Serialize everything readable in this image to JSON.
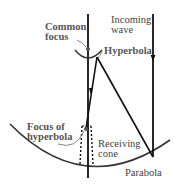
{
  "diagram": {
    "type": "cassegrain-antenna-geometry",
    "labels": {
      "common_focus": "Common\nfocus",
      "incoming_wave": "Incoming\nwave",
      "hyperbola": "Hyperbola",
      "focus_of_hyperbola": "Focus of\nhyperbola",
      "receiving_cone": "Receiving\ncone",
      "parabola": "Parabola"
    },
    "colors": {
      "line": "#111111",
      "curve": "#333333",
      "text": "#444444",
      "leader": "#666666"
    }
  }
}
